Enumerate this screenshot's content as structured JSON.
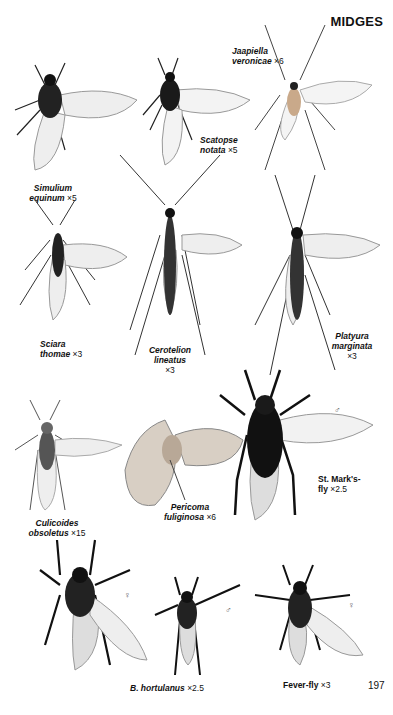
{
  "page": {
    "title": "MIDGES",
    "page_number": "197"
  },
  "specimens": [
    {
      "id": "simulium",
      "name_line1": "Simulium",
      "name_line2": "equinum",
      "magnification": "×5"
    },
    {
      "id": "scatopse",
      "name_line1": "Scatopse",
      "name_line2": "notata",
      "magnification": "×5"
    },
    {
      "id": "jaapiella",
      "name_line1": "Jaapiella",
      "name_line2": "veronicae",
      "magnification": "×6"
    },
    {
      "id": "sciara",
      "name_line1": "Sciara",
      "name_line2": "thomae",
      "magnification": "×3"
    },
    {
      "id": "cerotelion",
      "name_line1": "Cerotelion",
      "name_line2": "lineatus",
      "magnification": "×3"
    },
    {
      "id": "platyura",
      "name_line1": "Platyura",
      "name_line2": "marginata",
      "magnification": "×3"
    },
    {
      "id": "culicoides",
      "name_line1": "Culicoides",
      "name_line2": "obsoletus",
      "magnification": "×15"
    },
    {
      "id": "pericoma",
      "name_line1": "Pericoma",
      "name_line2": "fuliginosa",
      "magnification": "×6"
    },
    {
      "id": "stmarks",
      "name_line1": "St. Mark's-",
      "name_line2": "fly",
      "magnification": "×2.5",
      "sex": "♂"
    },
    {
      "id": "hortulanus",
      "name_line1": "B. hortulanus",
      "name_line2": "",
      "magnification": "×2.5",
      "sex_female": "♀",
      "sex_male": "♂"
    },
    {
      "id": "feverfly",
      "name_line1": "Fever-fly",
      "name_line2": "",
      "magnification": "×3",
      "sex": "♀"
    }
  ]
}
